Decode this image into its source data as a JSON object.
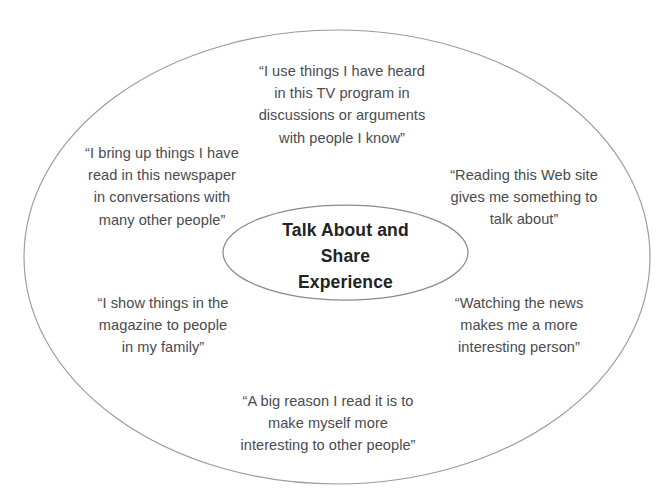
{
  "figure": {
    "center": {
      "label": "Talk About and\nShare\nExperience",
      "shape": "ellipse",
      "stroke_color": "#8a8a8f"
    },
    "outer": {
      "shape": "ellipse",
      "stroke_color": "#9a9aa0"
    },
    "quotes": [
      {
        "id": "tv",
        "position": "top",
        "text": "“I use things I have heard\nin this TV program in\ndiscussions or arguments\nwith people I know”"
      },
      {
        "id": "newspaper",
        "position": "upper-left",
        "text": "“I bring up things I have\nread in this newspaper\nin conversations with\nmany other people”"
      },
      {
        "id": "website",
        "position": "upper-right",
        "text": "“Reading this Web site\ngives me something to\ntalk about”"
      },
      {
        "id": "magazine",
        "position": "lower-left",
        "text": "“I show things in the\nmagazine to people\nin my family”"
      },
      {
        "id": "news",
        "position": "lower-right",
        "text": "“Watching the news\nmakes me a more\ninteresting person”"
      },
      {
        "id": "read",
        "position": "bottom",
        "text": "“A big reason I read it is to\nmake myself more\ninteresting to other people”"
      }
    ]
  },
  "colors": {
    "background": "#ffffff",
    "quote_text": "#4a4a4f",
    "center_text": "#232326",
    "outer_stroke": "#9a9aa0",
    "inner_stroke": "#8a8a8f"
  }
}
